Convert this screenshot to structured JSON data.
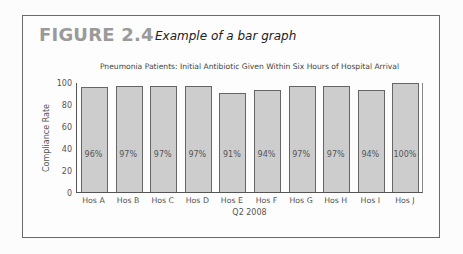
{
  "figure": {
    "label": "FIGURE 2.4",
    "caption": "Example of a bar graph"
  },
  "chart_data": {
    "type": "bar",
    "title": "Pneumonia Patients: Initial Antibiotic Given Within Six Hours of Hospital Arrival",
    "xlabel": "Q2 2008",
    "ylabel": "Compliance Rate",
    "categories": [
      "Hos A",
      "Hos B",
      "Hos C",
      "Hos D",
      "Hos E",
      "Hos F",
      "Hos G",
      "Hos H",
      "Hos I",
      "Hos J"
    ],
    "values": [
      96,
      97,
      97,
      97,
      91,
      94,
      97,
      97,
      94,
      100
    ],
    "data_labels": [
      "96%",
      "97%",
      "97%",
      "97%",
      "91%",
      "94%",
      "97%",
      "97%",
      "94%",
      "100%"
    ],
    "ylim": [
      0,
      100
    ],
    "yticks": [
      0,
      20,
      40,
      60,
      80,
      100
    ],
    "grid": false,
    "legend": null,
    "bar_color": "#cdcdcd",
    "bar_edge_color": "#666666"
  }
}
